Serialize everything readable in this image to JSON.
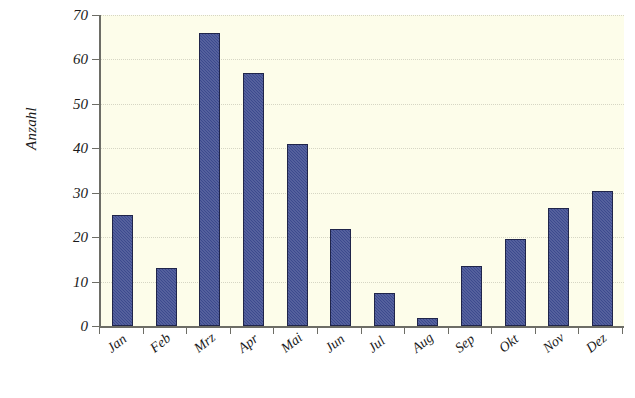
{
  "chart_data": {
    "type": "bar",
    "title": "",
    "subtitle": "",
    "xlabel": "",
    "ylabel": "Anzahl",
    "ylim": [
      0,
      70
    ],
    "ytick_step": 10,
    "ytick_labels": [
      "0",
      "10",
      "20",
      "30",
      "40",
      "50",
      "60",
      "70"
    ],
    "ytick_values": [
      0,
      10,
      20,
      30,
      40,
      50,
      60,
      70
    ],
    "grid": true,
    "grid_axis": "y",
    "legend": false,
    "legend_position": "none",
    "categories": [
      "Jan",
      "Feb",
      "Mrz",
      "Apr",
      "Mai",
      "Jun",
      "Jul",
      "Aug",
      "Sep",
      "Okt",
      "Nov",
      "Dez"
    ],
    "values": [
      25,
      13,
      66,
      57,
      41,
      21.8,
      7.5,
      1.8,
      13.5,
      19.5,
      26.5,
      30.5
    ],
    "series": [
      {
        "name": "Anzahl",
        "values": [
          25,
          13,
          66,
          57,
          41,
          21.8,
          7.5,
          1.8,
          13.5,
          19.5,
          26.5,
          30.5
        ]
      }
    ],
    "colors": {
      "bar_fill": "#3c4a8e",
      "bar_border": "#20254a",
      "plot_background": "#fdfdea",
      "page_background": "#ffffff",
      "axis_line": "#6d6d66",
      "gridline": "#d6d6c4",
      "text": "#1a1a1a"
    }
  }
}
